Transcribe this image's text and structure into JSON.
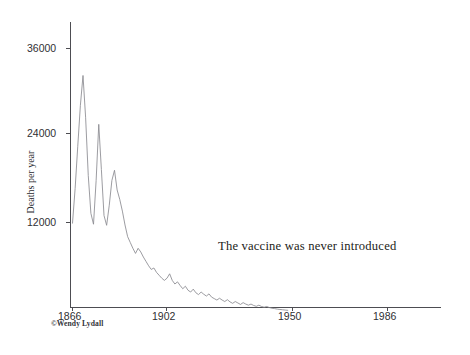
{
  "figure": {
    "annotation": "The vaccine was never introduced",
    "credit": "©Wendy Lydall"
  },
  "axes": {
    "y_title": "Deaths per year",
    "y_ticks": [
      "36000",
      "24000",
      "12000"
    ],
    "x_ticks": [
      "1866",
      "1902",
      "1950",
      "1986"
    ]
  },
  "chart_data": {
    "type": "line",
    "title": "",
    "subtitle": "",
    "xlabel": "",
    "ylabel": "Deaths per year",
    "xlim": [
      1866,
      1997
    ],
    "ylim": [
      0,
      40000
    ],
    "xticks": [
      1866,
      1902,
      1950,
      1986
    ],
    "yticks": [
      12000,
      24000,
      36000
    ],
    "grid": false,
    "legend": null,
    "annotations": [
      {
        "text": "The vaccine was never introduced",
        "x": 1923,
        "y": 8200
      },
      {
        "text": "©Wendy Lydall",
        "x": 1859,
        "y": -2500
      }
    ],
    "series": [
      {
        "name": "Deaths per year",
        "x": [
          1866,
          1867,
          1868,
          1869,
          1870,
          1871,
          1872,
          1873,
          1874,
          1875,
          1876,
          1877,
          1878,
          1879,
          1880,
          1881,
          1882,
          1883,
          1884,
          1885,
          1886,
          1887,
          1888,
          1889,
          1890,
          1891,
          1892,
          1893,
          1894,
          1895,
          1896,
          1897,
          1898,
          1899,
          1900,
          1901,
          1902,
          1903,
          1904,
          1905,
          1906,
          1907,
          1908,
          1909,
          1910,
          1911,
          1912,
          1913,
          1914,
          1915,
          1916,
          1917,
          1918,
          1919,
          1920,
          1921,
          1922,
          1923,
          1924,
          1925,
          1926,
          1927,
          1928,
          1929,
          1930,
          1931,
          1932,
          1933,
          1934,
          1935,
          1936,
          1937,
          1938,
          1939,
          1940,
          1941,
          1942,
          1943,
          1944,
          1945,
          1946,
          1947,
          1948
        ],
        "y": [
          12050,
          16800,
          22600,
          28200,
          32300,
          26500,
          18600,
          13400,
          11900,
          17900,
          25600,
          19400,
          13100,
          11750,
          14500,
          17900,
          19300,
          16600,
          15300,
          13700,
          11800,
          10200,
          9400,
          8600,
          7900,
          8600,
          8100,
          7400,
          6800,
          6200,
          5700,
          5900,
          5300,
          4900,
          4500,
          4200,
          4500,
          5100,
          4200,
          3700,
          4000,
          3500,
          3050,
          3400,
          2850,
          2600,
          3000,
          2500,
          2250,
          2600,
          2300,
          2050,
          2350,
          1900,
          1700,
          1500,
          1750,
          1500,
          1300,
          1550,
          1250,
          1050,
          1300,
          1100,
          900,
          1150,
          950,
          800,
          950,
          760,
          640,
          800,
          620,
          520,
          620,
          470,
          380,
          330,
          260,
          210,
          170,
          130,
          95
        ]
      }
    ]
  }
}
